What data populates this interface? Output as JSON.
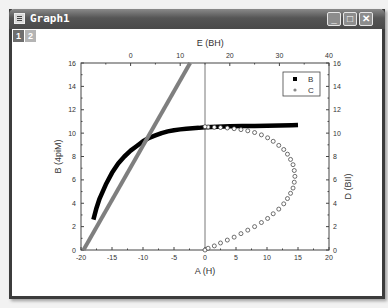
{
  "window": {
    "title": "Graph1",
    "icon": "graph-window-icon",
    "controls": {
      "minimize": "_",
      "maximize": "□",
      "close": "✕"
    }
  },
  "layers": [
    {
      "label": "1",
      "active": true
    },
    {
      "label": "2",
      "active": false
    }
  ],
  "chart_data": {
    "type": "scatter",
    "axes": {
      "bottom": {
        "label": "A (H)",
        "range": [
          -20,
          20
        ],
        "ticks": [
          "-20",
          "-15",
          "-10",
          "-5",
          "0",
          "5",
          "10",
          "15",
          "20"
        ]
      },
      "left": {
        "label": "B (4piM)",
        "range": [
          0,
          16
        ],
        "ticks": [
          "0",
          "2",
          "4",
          "6",
          "8",
          "10",
          "12",
          "14",
          "16"
        ]
      },
      "top": {
        "label": "E (BH)",
        "range": [
          -10,
          40
        ],
        "ticks": [
          "0",
          "10",
          "20",
          "30",
          "40"
        ]
      },
      "right": {
        "label": "D (BII)",
        "range": [
          0,
          16
        ],
        "ticks": [
          "0",
          "2",
          "4",
          "6",
          "8",
          "10",
          "12",
          "14",
          "16"
        ]
      }
    },
    "legend": {
      "entries": [
        "B",
        "C"
      ],
      "position": "top-right-inside"
    },
    "series": [
      {
        "name": "B",
        "marker": "filled-square",
        "color": "#000000",
        "axes": "bottom-left",
        "x": [
          -18,
          -17.5,
          -17,
          -16,
          -15,
          -14,
          -13,
          -12,
          -11,
          -10,
          -9,
          -8,
          -7,
          -6,
          -5,
          -4,
          -3,
          -2,
          -1,
          0,
          2,
          4,
          6,
          8,
          10,
          12,
          14,
          15
        ],
        "y": [
          2.6,
          3.6,
          4.4,
          5.6,
          6.6,
          7.4,
          8.0,
          8.5,
          8.9,
          9.3,
          9.6,
          9.8,
          10.0,
          10.15,
          10.25,
          10.32,
          10.38,
          10.42,
          10.45,
          10.5,
          10.55,
          10.58,
          10.6,
          10.62,
          10.64,
          10.66,
          10.68,
          10.7
        ]
      },
      {
        "name": "C",
        "marker": "open-circle",
        "color": "#000000",
        "axes": "bottom-right",
        "x": [
          0,
          0.5,
          1.5,
          2.5,
          3.6,
          4.7,
          5.8,
          6.9,
          8.0,
          9.1,
          10.1,
          11.0,
          11.9,
          12.7,
          13.3,
          13.8,
          14.2,
          14.4,
          14.5,
          14.4,
          14.2,
          13.8,
          13.3,
          12.7,
          11.9,
          11.0,
          10.1,
          9.1,
          8.0,
          6.9,
          5.8,
          4.7,
          3.6,
          2.5,
          1.5,
          0.5,
          0
        ],
        "y": [
          0,
          0.15,
          0.35,
          0.6,
          0.85,
          1.1,
          1.4,
          1.7,
          2.0,
          2.35,
          2.7,
          3.1,
          3.5,
          3.95,
          4.4,
          4.85,
          5.3,
          5.8,
          6.3,
          6.8,
          7.3,
          7.75,
          8.2,
          8.6,
          8.95,
          9.3,
          9.6,
          9.85,
          10.05,
          10.2,
          10.3,
          10.38,
          10.44,
          10.48,
          10.5,
          10.52,
          10.55
        ]
      },
      {
        "name": "E-line",
        "marker": "thick-line",
        "color": "#7f7f7f",
        "axes": "top-right",
        "x": [
          -9.5,
          12
        ],
        "y": [
          0,
          16
        ]
      }
    ],
    "grid": false,
    "extra_lines": [
      {
        "type": "vertical",
        "at_x": 0,
        "color": "#555555"
      }
    ]
  }
}
